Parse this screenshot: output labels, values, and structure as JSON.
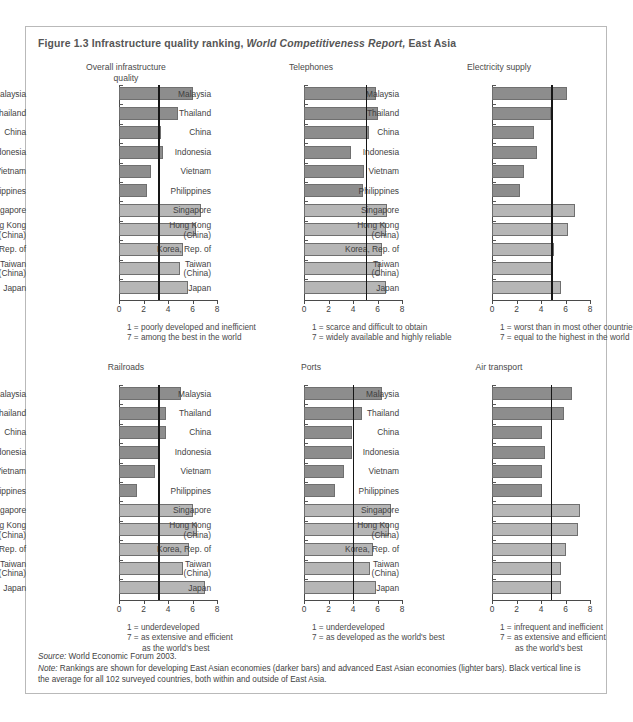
{
  "figure": {
    "label": "Figure 1.3",
    "title_plain": "Infrastructure quality ranking,",
    "title_italic": "World Competitiveness Report,",
    "title_tail": "East Asia"
  },
  "axis": {
    "ticks": [
      0,
      2,
      4,
      6,
      8
    ],
    "min": 0,
    "max": 8
  },
  "colors": {
    "developing_bar": "#8d8d8d",
    "advanced_bar": "#b6b6b6",
    "average_line": "#161616",
    "frame": "#b9b9b9",
    "text": "#3f3f3f"
  },
  "categories": [
    "Malaysia",
    "Thailand",
    "China",
    "Indonesia",
    "Vietnam",
    "Philippines",
    "Singapore",
    "Hong Kong\n(China)",
    "Korea, Rep. of",
    "Taiwan\n(China)",
    "Japan"
  ],
  "group_of_category": [
    "developing",
    "developing",
    "developing",
    "developing",
    "developing",
    "developing",
    "advanced",
    "advanced",
    "advanced",
    "advanced",
    "advanced"
  ],
  "footer": {
    "source_label": "Source:",
    "source_text": "World Economic Forum 2003.",
    "note_label": "Note:",
    "note_text": "Rankings are shown for developing East Asian economies (darker bars) and advanced East Asian economies (lighter bars). Black vertical line is the average for all 102 surveyed countries, both within and outside of East Asia."
  },
  "chart_data": [
    {
      "type": "bar",
      "id": "overall-infrastructure-quality",
      "title": "Overall infrastructure\nquality",
      "title_line1": "Overall infrastructure",
      "title_line2": "quality",
      "orientation": "horizontal",
      "xlabel": "",
      "ylabel": "",
      "xlim": [
        0,
        8
      ],
      "xticks": [
        0,
        2,
        4,
        6,
        8
      ],
      "grid": false,
      "average_line": 3.2,
      "legend": [
        "1 = poorly developed and inefficient",
        "7 = among the best in the world"
      ],
      "legend_indent": [
        false,
        false
      ],
      "categories": [
        "Malaysia",
        "Thailand",
        "China",
        "Indonesia",
        "Vietnam",
        "Philippines",
        "Singapore",
        "Hong Kong (China)",
        "Korea, Rep. of",
        "Taiwan (China)",
        "Japan"
      ],
      "values": [
        6.0,
        4.8,
        3.4,
        3.6,
        2.6,
        2.3,
        6.7,
        6.3,
        5.2,
        5.0,
        5.6
      ]
    },
    {
      "type": "bar",
      "id": "telephones",
      "title": "Telephones",
      "title_line1": "Telephones",
      "title_line2": "",
      "orientation": "horizontal",
      "xlabel": "",
      "ylabel": "",
      "xlim": [
        0,
        8
      ],
      "xticks": [
        0,
        2,
        4,
        6,
        8
      ],
      "grid": false,
      "average_line": 5.05,
      "legend": [
        "1 = scarce and difficult to obtain",
        "7 = widely available and highly reliable"
      ],
      "legend_indent": [
        false,
        false
      ],
      "categories": [
        "Malaysia",
        "Thailand",
        "China",
        "Indonesia",
        "Vietnam",
        "Philippines",
        "Singapore",
        "Hong Kong (China)",
        "Korea, Rep. of",
        "Taiwan (China)",
        "Japan"
      ],
      "values": [
        5.9,
        6.0,
        5.3,
        3.8,
        4.9,
        4.8,
        6.8,
        6.7,
        6.4,
        6.2,
        6.7
      ]
    },
    {
      "type": "bar",
      "id": "electricity-supply",
      "title": "Electricity supply",
      "title_line1": "Electricity supply",
      "title_line2": "",
      "orientation": "horizontal",
      "xlabel": "",
      "ylabel": "",
      "xlim": [
        0,
        8
      ],
      "xticks": [
        0,
        2,
        4,
        6,
        8
      ],
      "grid": false,
      "average_line": 4.85,
      "legend": [
        "1 = worst than in most other countries",
        "7 = equal to the highest in the world"
      ],
      "legend_indent": [
        false,
        false
      ],
      "categories": [
        "Malaysia",
        "Thailand",
        "China",
        "Indonesia",
        "Vietnam",
        "Philippines",
        "Singapore",
        "Hong Kong (China)",
        "Korea, Rep. of",
        "Taiwan (China)",
        "Japan"
      ],
      "values": [
        6.1,
        4.8,
        3.4,
        3.7,
        2.6,
        2.3,
        6.8,
        6.2,
        5.1,
        4.9,
        5.6
      ]
    },
    {
      "type": "bar",
      "id": "railroads",
      "title": "Railroads",
      "title_line1": "Railroads",
      "title_line2": "",
      "orientation": "horizontal",
      "xlabel": "",
      "ylabel": "",
      "xlim": [
        0,
        8
      ],
      "xticks": [
        0,
        2,
        4,
        6,
        8
      ],
      "grid": false,
      "average_line": 3.2,
      "legend": [
        "1 = underdeveloped",
        "7 = as extensive and efficient",
        "as the world's best"
      ],
      "legend_indent": [
        false,
        false,
        true
      ],
      "categories": [
        "Malaysia",
        "Thailand",
        "China",
        "Indonesia",
        "Vietnam",
        "Philippines",
        "Singapore",
        "Hong Kong (China)",
        "Korea, Rep. of",
        "Taiwan (China)",
        "Japan"
      ],
      "values": [
        5.1,
        3.8,
        3.8,
        3.3,
        2.9,
        1.5,
        6.0,
        6.4,
        5.7,
        5.2,
        7.0
      ]
    },
    {
      "type": "bar",
      "id": "ports",
      "title": "Ports",
      "title_line1": "Ports",
      "title_line2": "",
      "orientation": "horizontal",
      "xlabel": "",
      "ylabel": "",
      "xlim": [
        0,
        8
      ],
      "xticks": [
        0,
        2,
        4,
        6,
        8
      ],
      "grid": false,
      "average_line": 4.0,
      "legend": [
        "1 = underdeveloped",
        "7 = as developed as the world's best"
      ],
      "legend_indent": [
        false,
        false
      ],
      "categories": [
        "Malaysia",
        "Thailand",
        "China",
        "Indonesia",
        "Vietnam",
        "Philippines",
        "Singapore",
        "Hong Kong (China)",
        "Korea, Rep. of",
        "Taiwan (China)",
        "Japan"
      ],
      "values": [
        6.4,
        4.7,
        3.9,
        3.9,
        3.3,
        2.5,
        7.1,
        6.9,
        5.6,
        5.4,
        5.9
      ]
    },
    {
      "type": "bar",
      "id": "air-transport",
      "title": "Air transport",
      "title_line1": "Air transport",
      "title_line2": "",
      "orientation": "horizontal",
      "xlabel": "",
      "ylabel": "",
      "xlim": [
        0,
        8
      ],
      "xticks": [
        0,
        2,
        4,
        6,
        8
      ],
      "grid": false,
      "average_line": 4.8,
      "legend": [
        "1 = infrequent and inefficient",
        "7 = as extensive and efficient",
        "as the world's best"
      ],
      "legend_indent": [
        false,
        false,
        true
      ],
      "categories": [
        "Malaysia",
        "Thailand",
        "China",
        "Indonesia",
        "Vietnam",
        "Philippines",
        "Singapore",
        "Hong Kong (China)",
        "Korea, Rep. of",
        "Taiwan (China)",
        "Japan"
      ],
      "values": [
        6.5,
        5.9,
        4.1,
        4.3,
        4.1,
        4.1,
        7.2,
        7.0,
        6.0,
        5.6,
        5.6
      ]
    }
  ]
}
